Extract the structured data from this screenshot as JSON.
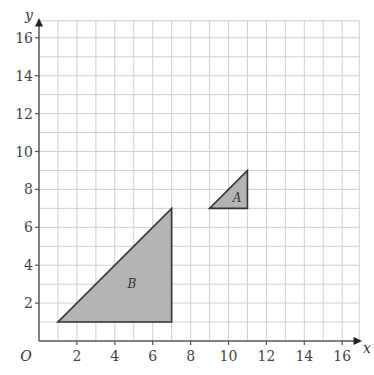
{
  "diagram": {
    "type": "coordinate-grid",
    "x_axis": {
      "label": "x",
      "min": 0,
      "max": 16,
      "tick_labels": [
        "2",
        "4",
        "6",
        "8",
        "10",
        "12",
        "14",
        "16"
      ]
    },
    "y_axis": {
      "label": "y",
      "min": 0,
      "max": 16,
      "tick_labels": [
        "2",
        "4",
        "6",
        "8",
        "10",
        "12",
        "14",
        "16"
      ]
    },
    "origin_label": "O",
    "shapes": [
      {
        "label": "A",
        "vertices": [
          [
            9,
            7
          ],
          [
            11,
            7
          ],
          [
            11,
            9
          ]
        ],
        "fill": "#b3b3b3"
      },
      {
        "label": "B",
        "vertices": [
          [
            1,
            1
          ],
          [
            7,
            1
          ],
          [
            7,
            7
          ]
        ],
        "fill": "#b3b3b3"
      }
    ],
    "colors": {
      "grid": "#cfcfcf",
      "axis": "#555555",
      "shape_stroke": "#333333"
    }
  }
}
